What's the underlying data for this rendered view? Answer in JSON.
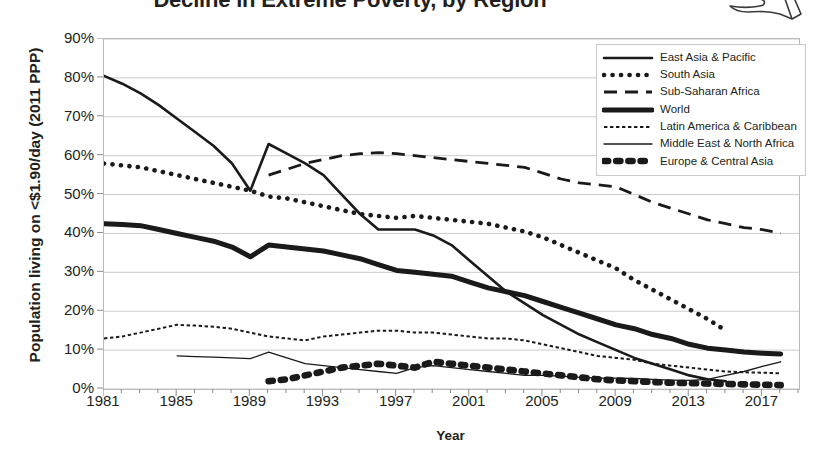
{
  "title": "Decline in Extreme Poverty, by Region",
  "icon": {
    "name": "giving-hand-icon"
  },
  "axes": {
    "ylabel": "Population living on <$1.90/day (2011 PPP)",
    "xlabel": "Year",
    "yticks": [
      "0%",
      "10%",
      "20%",
      "30%",
      "40%",
      "50%",
      "60%",
      "70%",
      "80%",
      "90%"
    ],
    "xticks": [
      "1981",
      "1985",
      "1989",
      "1993",
      "1997",
      "2001",
      "2005",
      "2009",
      "2013",
      "2017"
    ]
  },
  "legend": [
    {
      "label": "East Asia & Pacific",
      "style": "solid-medium"
    },
    {
      "label": "South Asia",
      "style": "dotted-round"
    },
    {
      "label": "Sub-Saharan Africa",
      "style": "dashed-long"
    },
    {
      "label": "World",
      "style": "solid-thick"
    },
    {
      "label": "Latin America & Caribbean",
      "style": "dotted-fine"
    },
    {
      "label": "Middle East & North Africa",
      "style": "solid-thin"
    },
    {
      "label": "Europe & Central Asia",
      "style": "dotted-bold"
    }
  ],
  "chart_data": {
    "type": "line",
    "title": "Decline in Extreme Poverty, by Region",
    "xlabel": "Year",
    "ylabel": "Population living on <$1.90/day (2011 PPP)",
    "xlim": [
      1981,
      2019
    ],
    "ylim": [
      0,
      90
    ],
    "yunit": "%",
    "grid": "horizontal",
    "legend_position": "top-right",
    "x": [
      1981,
      1982,
      1983,
      1984,
      1985,
      1986,
      1987,
      1988,
      1989,
      1990,
      1991,
      1992,
      1993,
      1994,
      1995,
      1996,
      1997,
      1998,
      1999,
      2000,
      2001,
      2002,
      2003,
      2004,
      2005,
      2006,
      2007,
      2008,
      2009,
      2010,
      2011,
      2012,
      2013,
      2014,
      2015,
      2016,
      2017,
      2018
    ],
    "series": [
      {
        "name": "East Asia & Pacific",
        "style": "solid-medium",
        "x": [
          1981,
          1982,
          1983,
          1984,
          1985,
          1986,
          1987,
          1988,
          1989,
          1990,
          1991,
          1992,
          1993,
          1994,
          1995,
          1996,
          1997,
          1998,
          1999,
          2000,
          2001,
          2002,
          2003,
          2004,
          2005,
          2006,
          2007,
          2008,
          2009,
          2010,
          2011,
          2012,
          2013,
          2014,
          2015
        ],
        "values": [
          80.5,
          78.5,
          76.0,
          73.0,
          69.5,
          66.0,
          62.5,
          58.0,
          51.0,
          63.0,
          60.5,
          58.0,
          55.0,
          50.0,
          45.0,
          41.0,
          41.0,
          41.0,
          39.5,
          37.0,
          33.0,
          29.0,
          25.0,
          22.0,
          19.0,
          16.5,
          14.0,
          12.0,
          10.0,
          8.0,
          6.5,
          5.0,
          3.5,
          2.5,
          2.0
        ]
      },
      {
        "name": "South Asia",
        "style": "dotted-round",
        "x": [
          1981,
          1982,
          1983,
          1984,
          1985,
          1986,
          1987,
          1988,
          1989,
          1990,
          1991,
          1992,
          1993,
          1994,
          1995,
          1996,
          1997,
          1998,
          1999,
          2000,
          2001,
          2002,
          2003,
          2004,
          2005,
          2006,
          2007,
          2008,
          2009,
          2010,
          2011,
          2012,
          2013,
          2014,
          2015
        ],
        "values": [
          58.0,
          57.5,
          57.0,
          56.0,
          55.0,
          54.0,
          53.0,
          52.0,
          51.0,
          49.5,
          49.0,
          48.0,
          47.0,
          46.0,
          45.0,
          44.5,
          44.0,
          44.5,
          44.0,
          43.5,
          43.0,
          42.5,
          41.5,
          40.5,
          39.0,
          37.0,
          35.0,
          33.0,
          31.0,
          28.0,
          25.5,
          23.0,
          20.5,
          18.0,
          15.0
        ]
      },
      {
        "name": "Sub-Saharan Africa",
        "style": "dashed-long",
        "x": [
          1990,
          1991,
          1992,
          1993,
          1994,
          1995,
          1996,
          1997,
          1998,
          1999,
          2000,
          2001,
          2002,
          2003,
          2004,
          2005,
          2006,
          2007,
          2008,
          2009,
          2010,
          2011,
          2012,
          2013,
          2014,
          2015,
          2016,
          2017,
          2018
        ],
        "values": [
          55.0,
          56.5,
          58.0,
          59.0,
          60.0,
          60.5,
          60.8,
          60.5,
          60.0,
          59.5,
          59.0,
          58.5,
          58.0,
          57.5,
          57.0,
          55.5,
          54.0,
          53.0,
          52.5,
          52.0,
          50.0,
          48.0,
          46.5,
          45.0,
          43.5,
          42.5,
          41.5,
          41.0,
          40.0
        ]
      },
      {
        "name": "World",
        "style": "solid-thick",
        "x": [
          1981,
          1982,
          1983,
          1984,
          1985,
          1986,
          1987,
          1988,
          1989,
          1990,
          1991,
          1992,
          1993,
          1994,
          1995,
          1996,
          1997,
          1998,
          1999,
          2000,
          2001,
          2002,
          2003,
          2004,
          2005,
          2006,
          2007,
          2008,
          2009,
          2010,
          2011,
          2012,
          2013,
          2014,
          2015,
          2016,
          2017,
          2018
        ],
        "values": [
          42.5,
          42.3,
          42.0,
          41.0,
          40.0,
          39.0,
          38.0,
          36.5,
          34.0,
          37.0,
          36.5,
          36.0,
          35.5,
          34.5,
          33.5,
          32.0,
          30.5,
          30.0,
          29.5,
          29.0,
          27.5,
          26.0,
          25.0,
          24.0,
          22.5,
          21.0,
          19.5,
          18.0,
          16.5,
          15.5,
          14.0,
          13.0,
          11.5,
          10.5,
          10.0,
          9.5,
          9.2,
          9.0
        ]
      },
      {
        "name": "Latin America & Caribbean",
        "style": "dotted-fine",
        "x": [
          1981,
          1982,
          1983,
          1984,
          1985,
          1986,
          1987,
          1988,
          1989,
          1990,
          1991,
          1992,
          1993,
          1994,
          1995,
          1996,
          1997,
          1998,
          1999,
          2000,
          2001,
          2002,
          2003,
          2004,
          2005,
          2006,
          2007,
          2008,
          2009,
          2010,
          2011,
          2012,
          2013,
          2014,
          2015,
          2016,
          2017,
          2018
        ],
        "values": [
          13.0,
          13.5,
          14.5,
          15.5,
          16.5,
          16.3,
          16.0,
          15.5,
          14.5,
          13.5,
          13.0,
          12.5,
          13.5,
          14.0,
          14.5,
          15.0,
          15.0,
          14.5,
          14.5,
          14.0,
          13.5,
          13.0,
          13.0,
          12.5,
          11.5,
          10.5,
          9.5,
          8.5,
          8.0,
          7.5,
          6.5,
          6.0,
          5.5,
          5.0,
          4.5,
          4.3,
          4.2,
          4.0
        ]
      },
      {
        "name": "Middle East & North Africa",
        "style": "solid-thin",
        "x": [
          1985,
          1986,
          1987,
          1988,
          1989,
          1990,
          1991,
          1992,
          1993,
          1994,
          1995,
          1996,
          1997,
          1998,
          1999,
          2000,
          2001,
          2002,
          2003,
          2004,
          2005,
          2006,
          2007,
          2008,
          2009,
          2010,
          2011,
          2012,
          2013,
          2014,
          2015,
          2016,
          2017,
          2018
        ],
        "values": [
          8.5,
          8.3,
          8.2,
          8.0,
          7.8,
          9.5,
          8.0,
          6.5,
          6.0,
          5.5,
          5.0,
          4.5,
          4.0,
          5.5,
          6.0,
          5.5,
          5.0,
          4.5,
          4.0,
          3.5,
          3.5,
          3.3,
          3.0,
          2.8,
          2.8,
          2.7,
          2.5,
          2.3,
          2.2,
          2.5,
          3.5,
          4.5,
          5.8,
          7.0
        ]
      },
      {
        "name": "Europe & Central Asia",
        "style": "dotted-bold",
        "x": [
          1990,
          1991,
          1992,
          1993,
          1994,
          1995,
          1996,
          1997,
          1998,
          1999,
          2000,
          2001,
          2002,
          2003,
          2004,
          2005,
          2006,
          2007,
          2008,
          2009,
          2010,
          2011,
          2012,
          2013,
          2014,
          2015,
          2016,
          2017,
          2018
        ],
        "values": [
          2.0,
          2.5,
          3.5,
          4.5,
          5.5,
          6.0,
          6.5,
          6.0,
          5.5,
          7.0,
          6.5,
          6.0,
          5.5,
          5.0,
          4.5,
          4.0,
          3.5,
          3.0,
          2.5,
          2.2,
          2.0,
          1.8,
          1.6,
          1.5,
          1.4,
          1.3,
          1.2,
          1.1,
          1.0
        ]
      }
    ]
  }
}
